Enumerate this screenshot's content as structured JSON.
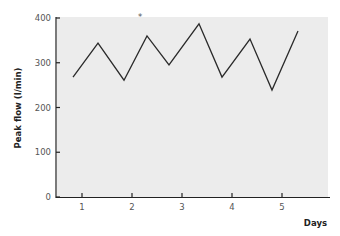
{
  "chart_data": {
    "type": "line",
    "title": "",
    "xlabel": "Days",
    "ylabel": "Peak flow (l/min)",
    "ylim": [
      0,
      400
    ],
    "xlim": [
      0.5,
      5.9
    ],
    "grid": false,
    "legend": null,
    "y_ticks": [
      0,
      100,
      200,
      300,
      400
    ],
    "x_ticks": [
      1,
      2,
      3,
      4,
      5
    ],
    "series": [
      {
        "name": "Peak flow",
        "x": [
          0.82,
          1.32,
          1.84,
          2.3,
          2.74,
          3.34,
          3.8,
          4.36,
          4.8,
          5.32
        ],
        "values": [
          268,
          344,
          261,
          360,
          295,
          387,
          268,
          353,
          239,
          371
        ]
      }
    ],
    "annotations": [
      {
        "text": "*",
        "x": 2.16,
        "y": 405
      }
    ],
    "colors": {
      "plot_bg": "#ececec",
      "line": "#2a2a2a",
      "axis": "#222222"
    }
  }
}
